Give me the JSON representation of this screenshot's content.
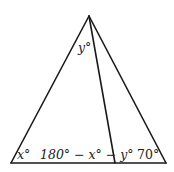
{
  "figure": {
    "type": "triangle-with-cevian",
    "labels": {
      "apex_angle": "y°",
      "left_angle": "x°",
      "middle_angle": "180° − x° − y°",
      "right_angle": "70°"
    }
  }
}
